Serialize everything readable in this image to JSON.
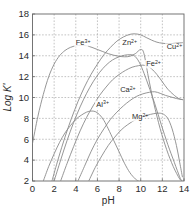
{
  "chart_data": {
    "type": "line",
    "title": "",
    "xlabel": "pH",
    "ylabel": "Log K'",
    "xlim": [
      0,
      14
    ],
    "ylim": [
      2,
      18
    ],
    "xticks": [
      0,
      2,
      4,
      6,
      8,
      10,
      12,
      14
    ],
    "yticks": [
      2,
      4,
      6,
      8,
      10,
      12,
      14,
      16,
      18
    ],
    "xtick_labels": [
      "0",
      "2",
      "4",
      "6",
      "8",
      "10",
      "12",
      "14"
    ],
    "ytick_labels": [
      "2",
      "4",
      "6",
      "8",
      "10",
      "12",
      "14",
      "16",
      "18"
    ],
    "grid": true,
    "grid_style": "dotted",
    "legend": "inline-curve-labels",
    "series": [
      {
        "name": "Fe3+",
        "label_base": "Fe",
        "label_sup": "3+",
        "label_x": 4.0,
        "label_y": 15.0,
        "points": [
          [
            0.0,
            5.6
          ],
          [
            0.5,
            8.2
          ],
          [
            1.0,
            10.3
          ],
          [
            1.5,
            12.0
          ],
          [
            2.0,
            13.2
          ],
          [
            2.5,
            14.0
          ],
          [
            3.0,
            14.5
          ],
          [
            3.5,
            14.8
          ],
          [
            4.0,
            14.95
          ],
          [
            4.5,
            15.0
          ],
          [
            5.0,
            14.95
          ],
          [
            5.5,
            14.8
          ],
          [
            6.0,
            14.6
          ],
          [
            6.5,
            14.4
          ],
          [
            7.0,
            14.2
          ],
          [
            7.5,
            14.05
          ],
          [
            8.0,
            13.95
          ],
          [
            8.5,
            13.9
          ],
          [
            9.0,
            13.95
          ],
          [
            9.5,
            14.2
          ],
          [
            10.0,
            14.6
          ],
          [
            10.3,
            14.2
          ],
          [
            10.7,
            12.0
          ],
          [
            11.2,
            9.5
          ],
          [
            11.8,
            7.0
          ],
          [
            12.4,
            5.0
          ],
          [
            13.0,
            3.4
          ],
          [
            13.6,
            2.2
          ],
          [
            13.85,
            2.0
          ]
        ]
      },
      {
        "name": "Cu2+",
        "label_base": "Cu",
        "label_sup": "2+",
        "label_x": 12.4,
        "label_y": 14.6,
        "points": [
          [
            1.8,
            2.0
          ],
          [
            2.4,
            4.2
          ],
          [
            3.0,
            6.2
          ],
          [
            3.6,
            8.0
          ],
          [
            4.2,
            9.6
          ],
          [
            4.8,
            11.0
          ],
          [
            5.4,
            12.2
          ],
          [
            6.0,
            13.2
          ],
          [
            6.6,
            14.1
          ],
          [
            7.2,
            14.8
          ],
          [
            7.8,
            15.4
          ],
          [
            8.4,
            15.8
          ],
          [
            9.0,
            16.05
          ],
          [
            9.5,
            16.1
          ],
          [
            10.0,
            16.0
          ],
          [
            10.5,
            15.75
          ],
          [
            11.0,
            15.5
          ],
          [
            11.5,
            15.3
          ],
          [
            12.0,
            15.2
          ],
          [
            12.6,
            15.15
          ],
          [
            13.2,
            15.2
          ],
          [
            13.85,
            15.25
          ]
        ]
      },
      {
        "name": "Zn2+",
        "label_base": "Zn",
        "label_sup": "2+",
        "label_x": 8.3,
        "label_y": 15.0,
        "points": [
          [
            2.0,
            2.0
          ],
          [
            2.6,
            4.0
          ],
          [
            3.2,
            5.9
          ],
          [
            3.8,
            7.6
          ],
          [
            4.4,
            9.1
          ],
          [
            5.0,
            10.4
          ],
          [
            5.6,
            11.5
          ],
          [
            6.2,
            12.4
          ],
          [
            6.8,
            13.1
          ],
          [
            7.4,
            13.6
          ],
          [
            8.0,
            13.9
          ],
          [
            8.5,
            14.05
          ],
          [
            9.0,
            14.1
          ],
          [
            9.4,
            14.0
          ],
          [
            9.8,
            13.5
          ],
          [
            10.2,
            12.6
          ],
          [
            10.7,
            11.2
          ],
          [
            11.3,
            9.4
          ],
          [
            11.9,
            7.4
          ],
          [
            12.5,
            5.5
          ],
          [
            13.1,
            3.8
          ],
          [
            13.6,
            2.4
          ],
          [
            13.8,
            2.0
          ]
        ]
      },
      {
        "name": "Fe2+",
        "label_base": "Fe",
        "label_sup": "2+",
        "label_x": 10.5,
        "label_y": 13.0,
        "points": [
          [
            2.6,
            2.0
          ],
          [
            3.2,
            3.7
          ],
          [
            3.8,
            5.3
          ],
          [
            4.4,
            6.8
          ],
          [
            5.0,
            8.1
          ],
          [
            5.6,
            9.2
          ],
          [
            6.2,
            10.2
          ],
          [
            6.8,
            11.0
          ],
          [
            7.4,
            11.7
          ],
          [
            8.0,
            12.2
          ],
          [
            8.6,
            12.6
          ],
          [
            9.2,
            12.9
          ],
          [
            9.8,
            13.05
          ],
          [
            10.2,
            13.1
          ],
          [
            10.6,
            13.0
          ],
          [
            11.0,
            12.75
          ],
          [
            11.5,
            12.2
          ],
          [
            12.0,
            11.5
          ],
          [
            12.5,
            10.8
          ],
          [
            13.0,
            10.3
          ],
          [
            13.5,
            9.9
          ],
          [
            13.85,
            9.8
          ]
        ]
      },
      {
        "name": "Al3+",
        "label_base": "Al",
        "label_sup": "3+",
        "label_x": 5.9,
        "label_y": 9.1,
        "points": [
          [
            1.0,
            2.0
          ],
          [
            1.5,
            3.4
          ],
          [
            2.0,
            4.6
          ],
          [
            2.5,
            5.7
          ],
          [
            3.0,
            6.6
          ],
          [
            3.5,
            7.3
          ],
          [
            4.0,
            7.9
          ],
          [
            4.5,
            8.3
          ],
          [
            5.0,
            8.6
          ],
          [
            5.4,
            8.7
          ],
          [
            5.8,
            8.65
          ],
          [
            6.2,
            8.35
          ],
          [
            6.6,
            7.8
          ],
          [
            7.0,
            7.0
          ],
          [
            7.5,
            5.9
          ],
          [
            8.0,
            4.8
          ],
          [
            8.5,
            3.7
          ],
          [
            9.0,
            2.8
          ],
          [
            9.5,
            2.2
          ],
          [
            9.8,
            2.0
          ]
        ]
      },
      {
        "name": "Ca2+",
        "label_base": "Ca",
        "label_sup": "2+",
        "label_x": 8.1,
        "label_y": 10.5,
        "points": [
          [
            4.2,
            2.0
          ],
          [
            4.8,
            3.4
          ],
          [
            5.4,
            4.8
          ],
          [
            6.0,
            6.0
          ],
          [
            6.6,
            7.0
          ],
          [
            7.2,
            7.9
          ],
          [
            7.8,
            8.6
          ],
          [
            8.4,
            9.2
          ],
          [
            9.0,
            9.7
          ],
          [
            9.6,
            10.1
          ],
          [
            10.2,
            10.35
          ],
          [
            10.8,
            10.5
          ],
          [
            11.3,
            10.55
          ],
          [
            11.8,
            10.4
          ],
          [
            12.3,
            10.2
          ],
          [
            12.8,
            10.05
          ],
          [
            13.3,
            9.9
          ],
          [
            13.85,
            9.8
          ]
        ]
      },
      {
        "name": "Mg2+",
        "label_base": "Mg",
        "label_sup": "2+",
        "label_x": 9.2,
        "label_y": 7.9,
        "points": [
          [
            5.2,
            2.0
          ],
          [
            5.8,
            3.3
          ],
          [
            6.4,
            4.4
          ],
          [
            7.0,
            5.4
          ],
          [
            7.6,
            6.2
          ],
          [
            8.2,
            6.9
          ],
          [
            8.8,
            7.4
          ],
          [
            9.4,
            7.8
          ],
          [
            10.0,
            8.1
          ],
          [
            10.6,
            8.3
          ],
          [
            11.2,
            8.45
          ],
          [
            11.7,
            8.5
          ],
          [
            12.1,
            8.4
          ],
          [
            12.5,
            8.0
          ],
          [
            12.9,
            7.0
          ],
          [
            13.3,
            5.4
          ],
          [
            13.6,
            3.8
          ],
          [
            13.85,
            2.4
          ]
        ]
      }
    ]
  }
}
